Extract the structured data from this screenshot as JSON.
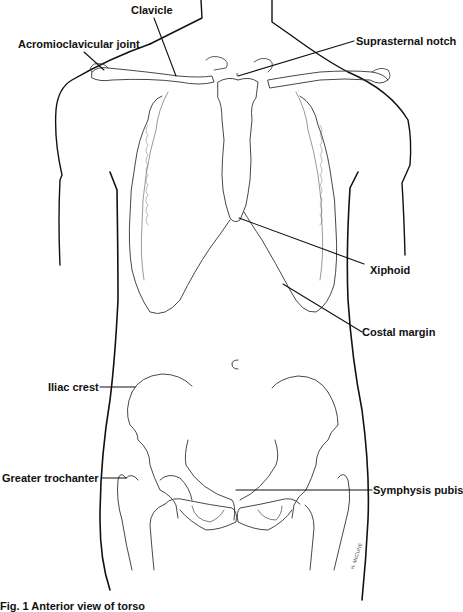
{
  "figure": {
    "line_color": "#111111",
    "bone_color": "#333333",
    "background": "#ffffff"
  },
  "labels": {
    "clavicle": "Clavicle",
    "acromioclavicular_joint": "Acromioclavicular joint",
    "suprasternal_notch": "Suprasternal notch",
    "xiphoid": "Xiphoid",
    "costal_margin": "Costal margin",
    "iliac_crest": "Iliac crest",
    "greater_trochanter": "Greater trochanter",
    "symphysis_pubis": "Symphysis pubis"
  },
  "caption": "Fig. 1  Anterior view of torso",
  "artist_signature": "H. McCUNE"
}
